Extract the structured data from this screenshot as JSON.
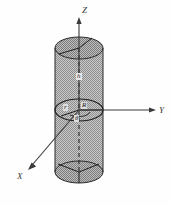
{
  "figure": {
    "title": "",
    "background_color": "#fefefe",
    "shading_color": "#a8a8a8",
    "line_color": "#2b2b2b"
  },
  "axes": {
    "z": {
      "label": "Z",
      "direction": "up",
      "icon": "arrow-up-icon"
    },
    "y": {
      "label": "Y",
      "direction": "right",
      "icon": "arrow-right-icon"
    },
    "x": {
      "label": "X",
      "direction": "down-left",
      "icon": "arrow-down-left-icon"
    }
  },
  "annotations": {
    "height": "h",
    "radius_small": "r",
    "radius_large": "R",
    "angle": "θ"
  },
  "shape": {
    "name": "cylinder",
    "top_ellipse": {
      "cx": 79,
      "cy": 48,
      "rx": 24,
      "ry": 11
    },
    "mid_ellipse": {
      "cx": 79,
      "cy": 110,
      "rx": 24,
      "ry": 11
    },
    "bottom_ellipse": {
      "cx": 79,
      "cy": 172,
      "rx": 24,
      "ry": 11
    }
  }
}
